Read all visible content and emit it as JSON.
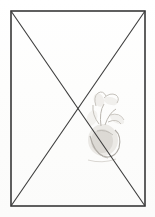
{
  "figure": {
    "medium": "pencil / ink line drawing on paper",
    "background_color": "#fdfdfc",
    "line_color": "#3a3a3a",
    "sketch_color": "#9a9389",
    "canvas": {
      "width": 155,
      "height": 217
    }
  },
  "frame": {
    "name": "outer-rectangle",
    "x": 11,
    "y": 11,
    "width": 134,
    "height": 195,
    "stroke_width": 1.6
  },
  "grid": {
    "vertical_lines": [
      {
        "label": "center-vertical",
        "x": 78,
        "y1": 11,
        "y2": 206
      }
    ],
    "horizontal_lines": [
      {
        "label": "horizontal-1",
        "y": 61,
        "x1": 11,
        "x2": 145
      },
      {
        "label": "horizontal-2-midline",
        "y": 109,
        "x1": 11,
        "x2": 145
      },
      {
        "label": "horizontal-3",
        "y": 157,
        "x1": 11,
        "x2": 145
      }
    ]
  },
  "diagonals": [
    {
      "label": "diagonal-tl-br",
      "x1": 11,
      "y1": 11,
      "x2": 145,
      "y2": 206
    },
    {
      "label": "diagonal-tr-bl",
      "x1": 145,
      "y1": 11,
      "x2": 11,
      "y2": 206
    }
  ],
  "intersection": {
    "label": "center-point",
    "x": 78,
    "y": 109
  },
  "sketch": {
    "label": "faint-plant-vessel-sketch",
    "description": "faded graphite sketch of a bulbous vessel with leafy stems rising",
    "bounds": {
      "x": 84,
      "y": 88,
      "width": 44,
      "height": 76
    },
    "opacity": 0.55
  }
}
